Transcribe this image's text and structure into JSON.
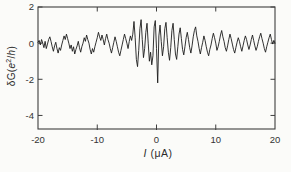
{
  "figure": {
    "background": "#fbfbf9",
    "frame_color": "#3f3f3f",
    "trace_color": "#1c1c1c",
    "tick_label_color": "#333333"
  },
  "chart": {
    "ylabel_parts": {
      "prefix": "δG(",
      "e": "e",
      "sup": "2",
      "slash": "/",
      "h": "h",
      "close": ")"
    },
    "xlabel_parts": {
      "symbol": "I",
      "unit": " (μA)"
    }
  },
  "chart_data": {
    "type": "line",
    "title": "",
    "xlabel": "I (μA)",
    "ylabel": "δG(e²/h)",
    "xlim": [
      -20,
      20
    ],
    "ylim": [
      -4.75,
      2
    ],
    "x_ticks": [
      -20,
      -10,
      0,
      10,
      20
    ],
    "y_ticks": [
      2,
      0,
      -2,
      -4
    ],
    "grid": false,
    "legend": null,
    "series_name": "conductance fluctuation trace",
    "x_start": -20,
    "x_step": 0.2,
    "n_points": 201,
    "y": [
      0.05,
      0.15,
      -0.1,
      0.2,
      0.0,
      -0.25,
      0.1,
      -0.3,
      -0.05,
      0.2,
      0.35,
      0.1,
      -0.2,
      -0.45,
      -0.15,
      0.05,
      -0.3,
      -0.55,
      -0.25,
      -0.4,
      -0.1,
      0.15,
      0.4,
      0.2,
      0.5,
      0.25,
      0.0,
      -0.3,
      -0.1,
      -0.45,
      -0.2,
      -0.6,
      -0.35,
      -0.15,
      0.1,
      -0.25,
      -0.5,
      -0.2,
      0.0,
      0.3,
      0.1,
      0.45,
      0.2,
      0.0,
      -0.35,
      -0.6,
      -0.3,
      -0.5,
      -0.2,
      0.05,
      0.3,
      0.6,
      0.35,
      0.15,
      0.45,
      0.2,
      -0.1,
      0.25,
      0.5,
      0.2,
      0.0,
      -0.3,
      -0.55,
      -0.25,
      0.05,
      0.35,
      0.1,
      -0.2,
      -0.5,
      -0.7,
      -0.4,
      -0.1,
      0.2,
      0.5,
      0.25,
      0.0,
      -0.3,
      0.1,
      0.4,
      0.15,
      0.5,
      1.2,
      0.3,
      -0.9,
      -1.3,
      -0.4,
      0.8,
      1.3,
      0.2,
      -0.8,
      -0.3,
      0.6,
      1.1,
      0.0,
      -1.0,
      -0.5,
      -1.2,
      -0.7,
      0.9,
      1.25,
      -0.3,
      -2.2,
      0.4,
      1.0,
      0.1,
      -0.7,
      -0.2,
      0.8,
      1.15,
      0.3,
      -0.5,
      -0.95,
      -0.25,
      0.7,
      1.1,
      0.2,
      -0.6,
      -0.9,
      -0.2,
      0.5,
      0.85,
      0.25,
      -0.35,
      -0.65,
      -0.2,
      0.3,
      0.6,
      0.2,
      -0.25,
      -0.55,
      -0.15,
      0.35,
      0.7,
      0.9,
      0.4,
      0.1,
      -0.3,
      -0.6,
      -0.25,
      0.05,
      0.4,
      0.15,
      -0.2,
      -0.5,
      -0.7,
      -0.35,
      -0.1,
      0.25,
      0.55,
      0.3,
      0.0,
      -0.4,
      -0.2,
      0.1,
      0.45,
      0.7,
      0.35,
      0.1,
      -0.25,
      -0.45,
      -0.15,
      0.2,
      0.5,
      0.25,
      -0.05,
      -0.35,
      -0.55,
      -0.25,
      0.05,
      0.3,
      0.1,
      -0.2,
      -0.45,
      -0.15,
      0.15,
      0.4,
      0.2,
      -0.1,
      -0.35,
      -0.1,
      0.2,
      0.45,
      0.15,
      -0.15,
      -0.4,
      -0.2,
      0.1,
      0.35,
      0.55,
      0.25,
      0.0,
      -0.3,
      -0.5,
      -0.2,
      0.05,
      0.3,
      0.5,
      0.2,
      -0.05,
      0.15,
      0.0
    ]
  }
}
